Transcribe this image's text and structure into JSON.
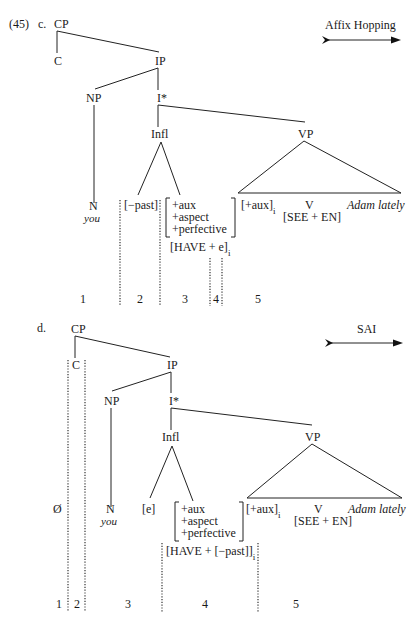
{
  "example_number": "(45)",
  "part_c": {
    "label": "c.",
    "rule_label": "Affix Hopping",
    "nodes": {
      "cp": "CP",
      "c": "C",
      "ip": "IP",
      "np": "NP",
      "ibar": "I*",
      "infl": "Infl",
      "vp": "VP",
      "n": "N",
      "you": "you",
      "past": "[−past]",
      "feat1": "+aux",
      "feat2": "+aspect",
      "feat3": "+perfective",
      "have": "[HAVE + e]",
      "have_sub": "i",
      "aux": "[+aux]",
      "aux_sub": "i",
      "v": "V",
      "see_en": "[SEE + EN]",
      "adam": "Adam lately"
    },
    "segments": [
      "1",
      "2",
      "3",
      "4",
      "5"
    ]
  },
  "part_d": {
    "label": "d.",
    "rule_label": "SAI",
    "nodes": {
      "cp": "CP",
      "c": "C",
      "ip": "IP",
      "np": "NP",
      "ibar": "I*",
      "infl": "Infl",
      "vp": "VP",
      "null": "Ø",
      "n": "N",
      "you": "you",
      "e": "[e]",
      "feat1": "+aux",
      "feat2": "+aspect",
      "feat3": "+perfective",
      "have": "[HAVE + [−past]]",
      "have_sub": "i",
      "aux": "[+aux]",
      "aux_sub": "i",
      "v": "V",
      "see_en": "[SEE + EN]",
      "adam": "Adam lately"
    },
    "segments": [
      "1",
      "2",
      "3",
      "4",
      "5"
    ]
  }
}
